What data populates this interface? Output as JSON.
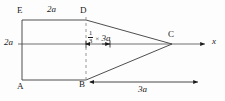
{
  "figure": {
    "type": "geometry-diagram",
    "vertices": [
      {
        "name": "E",
        "label": "E",
        "x": 22,
        "y": 20,
        "label_pos": "above-left"
      },
      {
        "name": "D",
        "label": "D",
        "x": 86,
        "y": 20,
        "label_pos": "above-left"
      },
      {
        "name": "A",
        "label": "A",
        "x": 22,
        "y": 80,
        "label_pos": "below-left"
      },
      {
        "name": "B",
        "label": "B",
        "x": 86,
        "y": 80,
        "label_pos": "below-left"
      },
      {
        "name": "C",
        "label": "C",
        "x": 172,
        "y": 44,
        "label_pos": "above-left"
      }
    ],
    "axis": {
      "label": "x",
      "orientation": "horizontal",
      "arrow": "right",
      "y": 44
    },
    "dimensions": [
      {
        "name": "top-width",
        "label": "2a",
        "value": "2a",
        "position": "top-edge-midspan"
      },
      {
        "name": "left-height",
        "label": "2a",
        "value": "2a",
        "position": "left-edge-mid"
      },
      {
        "name": "centroid-offset",
        "label_numerator": "1",
        "label_denominator": "3",
        "label_times": "×",
        "label_term": "3a",
        "full_label": "1/3 × 3a",
        "position": "axis-right-of-D-B-line"
      },
      {
        "name": "triangle-base-length",
        "label": "3a",
        "value": "3a",
        "position": "bottom-right"
      }
    ],
    "dashed_lines": [
      {
        "name": "DB-dashed-vertical",
        "from": "D",
        "to": "B"
      }
    ],
    "arrows": [
      {
        "name": "x-axis-arrow",
        "direction": "right"
      },
      {
        "name": "centroid-dim-arrow-left",
        "direction": "left"
      },
      {
        "name": "centroid-dim-arrow-right",
        "direction": "right"
      },
      {
        "name": "base-dim-arrow-left",
        "direction": "left"
      },
      {
        "name": "base-dim-arrow-right",
        "direction": "right"
      }
    ],
    "stroke_color": "#1a1a1a",
    "background_color": "#fdfdfd"
  }
}
